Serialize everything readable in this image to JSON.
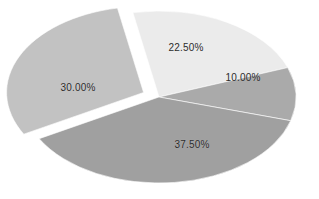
{
  "chart_data": {
    "type": "pie",
    "title": "",
    "subtitle": "",
    "xlabel": "",
    "ylabel": "",
    "legend": "none",
    "grid": false,
    "background_color": "#ffffff",
    "label_color": "#2b2b2b",
    "label_format": "percent_two_decimals",
    "shape": "ellipse",
    "categories": [
      "Slice 1",
      "Slice 2",
      "Slice 3",
      "Slice 4"
    ],
    "values": [
      22.5,
      10.0,
      37.5,
      30.0
    ],
    "labels": [
      "22.50%",
      "10.00%",
      "37.50%",
      "30.00%"
    ],
    "colors": [
      "#ebebeb",
      "#aaaaaa",
      "#a0a0a0",
      "#c2c2c2"
    ],
    "total": "100.00%",
    "slices": [
      {
        "label": "22.50%",
        "value": 22.5,
        "color": "#ebebeb",
        "exploded": false,
        "label_x": 186,
        "label_y": 47
      },
      {
        "label": "10.00%",
        "value": 10.0,
        "color": "#aaaaaa",
        "exploded": false,
        "label_x": 243,
        "label_y": 77
      },
      {
        "label": "37.50%",
        "value": 37.5,
        "color": "#a0a0a0",
        "exploded": false,
        "label_x": 192,
        "label_y": 144
      },
      {
        "label": "30.00%",
        "value": 30.0,
        "color": "#c2c2c2",
        "exploded": true,
        "label_x": 78,
        "label_y": 87
      }
    ]
  }
}
